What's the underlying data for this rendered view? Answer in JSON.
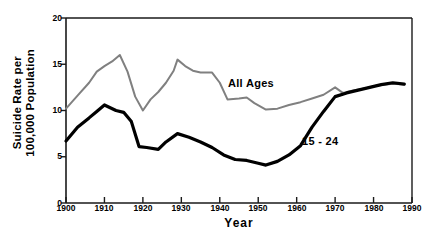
{
  "chart_data": {
    "type": "line",
    "title": "",
    "xlabel": "Year",
    "ylabel": "Suicide Rate per 100,000 Population",
    "ylabel_lines": [
      "Suicide Rate per",
      "100,000 Population"
    ],
    "xlim": [
      1900,
      1990
    ],
    "ylim": [
      0,
      20
    ],
    "xticks": [
      1900,
      1910,
      1920,
      1930,
      1940,
      1950,
      1960,
      1970,
      1980,
      1990
    ],
    "yticks": [
      0,
      5,
      10,
      15,
      20
    ],
    "grid": false,
    "legend_position": "inline-annotation",
    "series": [
      {
        "name": "All Ages",
        "color": "#808080",
        "line_width": 2,
        "label_x": 1959,
        "label_y": 13.2,
        "points": [
          {
            "x": 1900,
            "y": 10.2
          },
          {
            "x": 1903,
            "y": 11.6
          },
          {
            "x": 1906,
            "y": 13.0
          },
          {
            "x": 1908,
            "y": 14.2
          },
          {
            "x": 1910,
            "y": 14.8
          },
          {
            "x": 1912,
            "y": 15.3
          },
          {
            "x": 1914,
            "y": 16.0
          },
          {
            "x": 1916,
            "y": 14.2
          },
          {
            "x": 1918,
            "y": 11.5
          },
          {
            "x": 1920,
            "y": 10.0
          },
          {
            "x": 1922,
            "y": 11.2
          },
          {
            "x": 1924,
            "y": 12.0
          },
          {
            "x": 1926,
            "y": 13.0
          },
          {
            "x": 1928,
            "y": 14.3
          },
          {
            "x": 1929,
            "y": 15.5
          },
          {
            "x": 1931,
            "y": 14.8
          },
          {
            "x": 1933,
            "y": 14.3
          },
          {
            "x": 1935,
            "y": 14.1
          },
          {
            "x": 1938,
            "y": 14.1
          },
          {
            "x": 1940,
            "y": 13.0
          },
          {
            "x": 1942,
            "y": 11.2
          },
          {
            "x": 1945,
            "y": 11.3
          },
          {
            "x": 1947,
            "y": 11.4
          },
          {
            "x": 1949,
            "y": 10.8
          },
          {
            "x": 1952,
            "y": 10.1
          },
          {
            "x": 1955,
            "y": 10.2
          },
          {
            "x": 1958,
            "y": 10.6
          },
          {
            "x": 1961,
            "y": 10.9
          },
          {
            "x": 1964,
            "y": 11.3
          },
          {
            "x": 1967,
            "y": 11.7
          },
          {
            "x": 1970,
            "y": 12.5
          },
          {
            "x": 1972,
            "y": 11.9
          },
          {
            "x": 1975,
            "y": 12.2
          },
          {
            "x": 1978,
            "y": 12.4
          },
          {
            "x": 1981,
            "y": 12.7
          },
          {
            "x": 1985,
            "y": 12.9
          },
          {
            "x": 1988,
            "y": 12.8
          }
        ]
      },
      {
        "name": "15 - 24",
        "color": "#000000",
        "line_width": 3.2,
        "label_x": 1965,
        "label_y": 6.3,
        "points": [
          {
            "x": 1900,
            "y": 6.7
          },
          {
            "x": 1903,
            "y": 8.2
          },
          {
            "x": 1906,
            "y": 9.2
          },
          {
            "x": 1908,
            "y": 9.9
          },
          {
            "x": 1910,
            "y": 10.6
          },
          {
            "x": 1913,
            "y": 10.0
          },
          {
            "x": 1915,
            "y": 9.8
          },
          {
            "x": 1917,
            "y": 8.8
          },
          {
            "x": 1919,
            "y": 6.1
          },
          {
            "x": 1921,
            "y": 6.0
          },
          {
            "x": 1924,
            "y": 5.8
          },
          {
            "x": 1926,
            "y": 6.6
          },
          {
            "x": 1929,
            "y": 7.5
          },
          {
            "x": 1932,
            "y": 7.1
          },
          {
            "x": 1935,
            "y": 6.6
          },
          {
            "x": 1938,
            "y": 6.0
          },
          {
            "x": 1941,
            "y": 5.2
          },
          {
            "x": 1944,
            "y": 4.7
          },
          {
            "x": 1947,
            "y": 4.6
          },
          {
            "x": 1950,
            "y": 4.3
          },
          {
            "x": 1952,
            "y": 4.1
          },
          {
            "x": 1955,
            "y": 4.5
          },
          {
            "x": 1958,
            "y": 5.2
          },
          {
            "x": 1961,
            "y": 6.2
          },
          {
            "x": 1964,
            "y": 8.2
          },
          {
            "x": 1967,
            "y": 9.9
          },
          {
            "x": 1970,
            "y": 11.5
          },
          {
            "x": 1973,
            "y": 11.9
          },
          {
            "x": 1976,
            "y": 12.2
          },
          {
            "x": 1979,
            "y": 12.5
          },
          {
            "x": 1982,
            "y": 12.8
          },
          {
            "x": 1985,
            "y": 13.0
          },
          {
            "x": 1988,
            "y": 12.85
          }
        ]
      }
    ]
  },
  "axes": {
    "x_title": "Year",
    "y_title_line1": "Suicide Rate per",
    "y_title_line2": "100,000 Population",
    "x_tick_labels": [
      "1900",
      "1910",
      "1920",
      "1930",
      "1940",
      "1950",
      "1960",
      "1970",
      "1980",
      "1990"
    ],
    "y_tick_labels": [
      "20",
      "15",
      "10",
      "5",
      "0"
    ]
  },
  "annotations": {
    "all_ages": "All Ages",
    "age_15_24": "15 - 24"
  },
  "colors": {
    "all_ages_line": "#808080",
    "age_15_24_line": "#000000",
    "axis": "#1a1a1a",
    "background": "#ffffff"
  }
}
